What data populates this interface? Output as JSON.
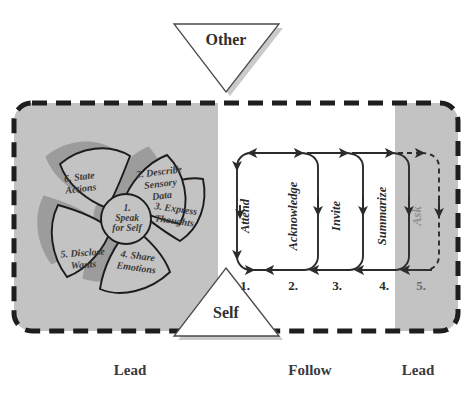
{
  "diagram": {
    "colors": {
      "gray_zone": "#c3c3c3",
      "white_zone": "#ffffff",
      "stroke": "#2b2b2b",
      "text": "#333333",
      "shadow": "#b5b5b5"
    }
  },
  "actors": {
    "other": {
      "label": "Other",
      "shape": "triangle-down"
    },
    "self": {
      "label": "Self",
      "shape": "triangle-up"
    }
  },
  "pinwheel": {
    "name": "speak-for-self-pinwheel",
    "center": {
      "number": "1.",
      "line1": "Speak",
      "line2": "for Self",
      "full": "1. Speak for Self"
    },
    "petals": [
      {
        "number": "2.",
        "label": "Describe Sensory Data",
        "lines": [
          "2. Describe",
          "Sensory",
          "Data"
        ]
      },
      {
        "number": "3.",
        "label": "Express Thoughts",
        "lines": [
          "3. Express",
          "Thoughts"
        ]
      },
      {
        "number": "4.",
        "label": "Share Emotions",
        "lines": [
          "4. Share",
          "Emotions"
        ]
      },
      {
        "number": "5.",
        "label": "Disclose Wants",
        "lines": [
          "5. Disclose",
          "Wants"
        ]
      },
      {
        "number": "6.",
        "label": "State Actions",
        "lines": [
          "6. State",
          "Actions"
        ]
      }
    ]
  },
  "listening_cycle": {
    "name": "listening-loop-sequence",
    "steps": [
      {
        "number": "1.",
        "label": "Attend",
        "zone": "Follow"
      },
      {
        "number": "2.",
        "label": "Acknowledge",
        "zone": "Follow"
      },
      {
        "number": "3.",
        "label": "Invite",
        "zone": "Follow"
      },
      {
        "number": "4.",
        "label": "Summarize",
        "zone": "Follow"
      },
      {
        "number": "5.",
        "label": "Ask",
        "zone": "Lead"
      }
    ]
  },
  "zones": [
    {
      "label": "Lead",
      "shade": "gray",
      "x_center": 130
    },
    {
      "label": "Follow",
      "shade": "white",
      "x_center": 310
    },
    {
      "label": "Lead",
      "shade": "gray",
      "x_center": 418
    }
  ]
}
